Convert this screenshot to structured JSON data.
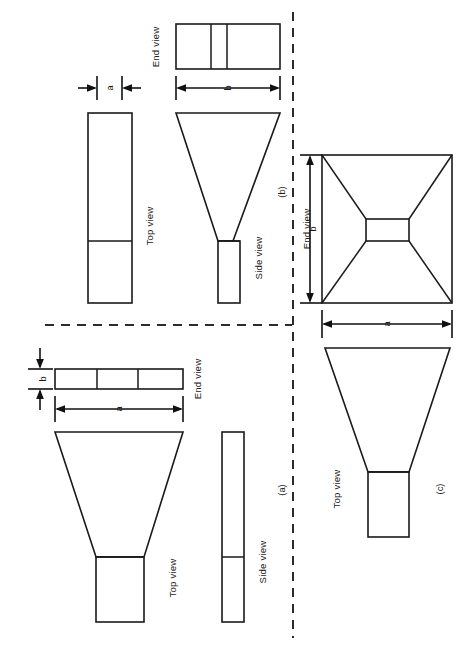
{
  "figure": {
    "background_color": "#ffffff",
    "line_color": "#1a1a1a",
    "dash_color": "#2b2b2b",
    "orientation_note": "All text rendered rotated 90 degrees (page is landscape content on portrait canvas)"
  },
  "panels": {
    "a": {
      "caption": "(a)",
      "views": {
        "top": "Top view",
        "side": "Side view",
        "end": "End view"
      },
      "dimensions": {
        "width": "a",
        "height": "b"
      }
    },
    "b": {
      "caption": "(b)",
      "views": {
        "top": "Top view",
        "side": "Side view",
        "end": "End view"
      },
      "dimensions": {
        "width": "a",
        "height": "b"
      }
    },
    "c": {
      "caption": "(c)",
      "views": {
        "top": "Top view",
        "end": "End view"
      },
      "dimensions": {
        "width": "a",
        "height": "b"
      }
    }
  },
  "labels": {
    "end_view_b": "End view",
    "dim_a_b_panel": "a",
    "dim_b_b_panel": "b",
    "top_view_b": "Top view",
    "side_view_b": "Side view",
    "caption_b": "(b)",
    "end_view_c": "End view",
    "dim_a_c": "a",
    "dim_b_c": "b",
    "top_view_c": "Top view",
    "caption_c": "(c)",
    "end_view_a": "End view",
    "dim_a_a": "a",
    "dim_b_a": "b",
    "top_view_a": "Top view",
    "side_view_a": "Side view",
    "caption_a": "(a)"
  }
}
